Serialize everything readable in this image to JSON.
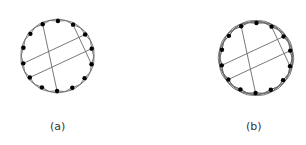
{
  "colors": {
    "edge": "#6a6a6a",
    "node": "#000000",
    "label": "#333333",
    "background": "#ffffff"
  },
  "panels": [
    {
      "id": "a",
      "label": "(a)",
      "label_pos": [
        50,
        120
      ],
      "center": [
        57.5,
        56
      ],
      "radius": 35,
      "node_count": 14,
      "start_angle_deg": -115,
      "node_radius": 2.2,
      "arc_skips": [
        2
      ],
      "chords": [
        [
          0,
          8
        ],
        [
          2,
          5
        ],
        [
          3,
          11
        ],
        [
          4,
          10
        ]
      ]
    },
    {
      "id": "b",
      "label": "(b)",
      "label_pos": [
        246,
        120
      ],
      "center": [
        256,
        58
      ],
      "radius": 35,
      "node_count": 14,
      "start_angle_deg": -115,
      "node_radius": 2.2,
      "arc_skips": [
        2,
        3
      ],
      "chords": [
        [
          0,
          8
        ],
        [
          2,
          5
        ],
        [
          3,
          11
        ],
        [
          4,
          10
        ]
      ]
    }
  ]
}
